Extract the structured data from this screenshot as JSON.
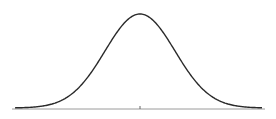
{
  "chart_data": {
    "type": "line",
    "title": "",
    "xlabel": "",
    "ylabel": "",
    "x": [
      -3.5,
      -3,
      -2.5,
      -2,
      -1.5,
      -1,
      -0.5,
      0,
      0.5,
      1,
      1.5,
      2,
      2.5,
      3,
      3.5
    ],
    "series": [
      {
        "name": "density",
        "values": [
          0.0009,
          0.0044,
          0.0175,
          0.054,
          0.1295,
          0.242,
          0.3521,
          0.3989,
          0.3521,
          0.242,
          0.1295,
          0.054,
          0.0175,
          0.0044,
          0.0009
        ]
      }
    ],
    "xticks": [
      0
    ],
    "xtick_labels": [
      ""
    ],
    "xlim": [
      -3.6,
      3.6
    ],
    "ylim": [
      0,
      0.4
    ],
    "grid": false,
    "legend": null,
    "colors": {
      "curve": "#2a2a2a",
      "axis": "#9a9a9a",
      "background": "#ffffff"
    },
    "layout": {
      "axis_y_px": 109,
      "axis_x_start_px": 12,
      "axis_x_end_px": 265,
      "center_x_px": 140,
      "peak_y_px": 14,
      "sigma_px": 35
    }
  }
}
